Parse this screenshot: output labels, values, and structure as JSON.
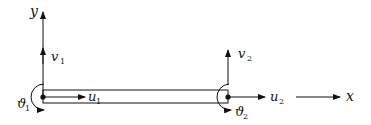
{
  "diagram": {
    "type": "beam element degrees of freedom",
    "axes": {
      "x_label": "x",
      "y_label": "y"
    },
    "nodes": [
      {
        "id": "node-1",
        "dofs": {
          "axial": {
            "symbol": "u",
            "sub": "1"
          },
          "transverse": {
            "symbol": "v",
            "sub": "1"
          },
          "rotation": {
            "symbol": "ϑ",
            "sub": "1"
          }
        }
      },
      {
        "id": "node-2",
        "dofs": {
          "axial": {
            "symbol": "u",
            "sub": "2"
          },
          "transverse": {
            "symbol": "v",
            "sub": "2"
          },
          "rotation": {
            "symbol": "ϑ",
            "sub": "2"
          }
        }
      }
    ],
    "colors": {
      "stroke": "#111111",
      "background": "#ffffff"
    }
  }
}
